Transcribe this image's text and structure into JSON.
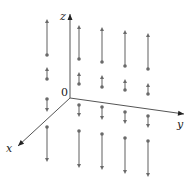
{
  "diagram": {
    "title": "",
    "colors": {
      "axes": "#555555",
      "vectors": "#7a7a7a",
      "labels": "#222222"
    },
    "axes": {
      "origin_label": "0",
      "x_label": "x",
      "y_label": "y",
      "z_label": "z",
      "origin": [
        70,
        98
      ],
      "x_end": [
        18,
        146
      ],
      "y_end": [
        184,
        114
      ],
      "z_end": [
        70,
        14
      ]
    },
    "vectors": [
      {
        "col": 1,
        "x": 47,
        "from": 55,
        "to": 19,
        "dir": "up"
      },
      {
        "col": 1,
        "x": 47,
        "from": 79,
        "to": 67,
        "dir": "up"
      },
      {
        "col": 1,
        "x": 47,
        "from": 99,
        "to": 112,
        "dir": "down"
      },
      {
        "col": 1,
        "x": 47,
        "from": 127,
        "to": 162,
        "dir": "down"
      },
      {
        "col": 2,
        "x": 79,
        "from": 59,
        "to": 25,
        "dir": "up"
      },
      {
        "col": 2,
        "x": 79,
        "from": 84,
        "to": 72,
        "dir": "up"
      },
      {
        "col": 2,
        "x": 79,
        "from": 105,
        "to": 117,
        "dir": "down"
      },
      {
        "col": 2,
        "x": 79,
        "from": 131,
        "to": 168,
        "dir": "down"
      },
      {
        "col": 3,
        "x": 102,
        "from": 62,
        "to": 27,
        "dir": "up"
      },
      {
        "col": 3,
        "x": 102,
        "from": 87,
        "to": 75,
        "dir": "up"
      },
      {
        "col": 3,
        "x": 102,
        "from": 107,
        "to": 120,
        "dir": "down"
      },
      {
        "col": 3,
        "x": 102,
        "from": 134,
        "to": 170,
        "dir": "down"
      },
      {
        "col": 4,
        "x": 125,
        "from": 66,
        "to": 30,
        "dir": "up"
      },
      {
        "col": 4,
        "x": 125,
        "from": 90,
        "to": 79,
        "dir": "up"
      },
      {
        "col": 4,
        "x": 125,
        "from": 112,
        "to": 124,
        "dir": "down"
      },
      {
        "col": 4,
        "x": 125,
        "from": 138,
        "to": 174,
        "dir": "down"
      },
      {
        "col": 5,
        "x": 148,
        "from": 69,
        "to": 33,
        "dir": "up"
      },
      {
        "col": 5,
        "x": 148,
        "from": 94,
        "to": 83,
        "dir": "up"
      },
      {
        "col": 5,
        "x": 148,
        "from": 116,
        "to": 128,
        "dir": "down"
      },
      {
        "col": 5,
        "x": 148,
        "from": 141,
        "to": 177,
        "dir": "down"
      }
    ]
  }
}
